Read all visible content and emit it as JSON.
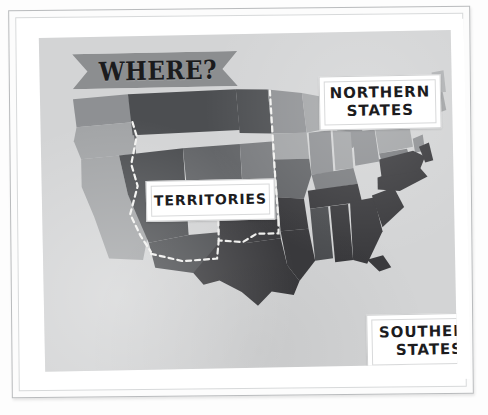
{
  "poster": {
    "banner_title": "WHERE?",
    "labels": {
      "northern": {
        "line1": "NORTHERN",
        "line2": "STATES"
      },
      "territories": {
        "line1": "TERRITORIES"
      },
      "southern": {
        "line1": "SOUTHERN",
        "line2": "STATES"
      }
    }
  },
  "map": {
    "kind": "united-states-regional-map",
    "background_color": "#d3d4d5",
    "banner_color": "#8c8e90",
    "legend": [
      {
        "key": "northern_states",
        "label": "NORTHERN STATES",
        "color": "#a7a9ab"
      },
      {
        "key": "southern_states",
        "label": "SOUTHERN STATES",
        "color": "#3c3c3f"
      },
      {
        "key": "territories",
        "label": "TERRITORIES",
        "color": "#6a6c6f"
      }
    ],
    "colors": {
      "pale": "#c4c5c7",
      "light": "#b0b2b4",
      "light_mid": "#a2a4a6",
      "mid": "#8e9093",
      "mid_dark": "#7a7c7f",
      "dark_mid": "#636568",
      "dark": "#4c4e51",
      "darkest": "#3a3a3d",
      "border_dashed": "#f2f2f0"
    }
  }
}
